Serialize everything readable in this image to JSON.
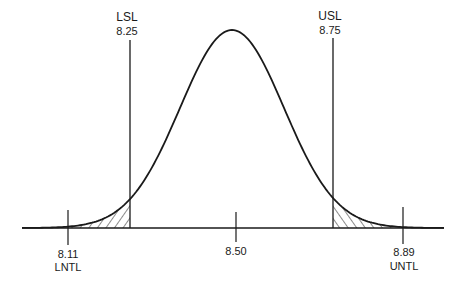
{
  "chart_data": {
    "type": "line",
    "title": "",
    "xlabel": "",
    "ylabel": "",
    "distribution": {
      "kind": "normal",
      "mean": 8.5,
      "sigma": 0.13
    },
    "x_ticks": [
      {
        "value": 8.11,
        "label": "8.11",
        "name": "LNTL"
      },
      {
        "value": 8.5,
        "label": "8.50",
        "name": ""
      },
      {
        "value": 8.89,
        "label": "8.89",
        "name": "UNTL"
      }
    ],
    "spec_limits": [
      {
        "name": "LSL",
        "value": 8.25,
        "label": "8.25"
      },
      {
        "name": "USL",
        "value": 8.75,
        "label": "8.75"
      }
    ],
    "shaded_regions": [
      "x < 8.25 (hatched)",
      "x > 8.75 (hatched)"
    ],
    "grid": false,
    "legend": null
  },
  "labels": {
    "lsl_name": "LSL",
    "lsl_value": "8.25",
    "usl_name": "USL",
    "usl_value": "8.75",
    "lntl_value": "8.11",
    "lntl_name": "LNTL",
    "center_value": "8.50",
    "untl_value": "8.89",
    "untl_name": "UNTL"
  },
  "colors": {
    "line": "#1a1a1a",
    "background": "#ffffff"
  }
}
